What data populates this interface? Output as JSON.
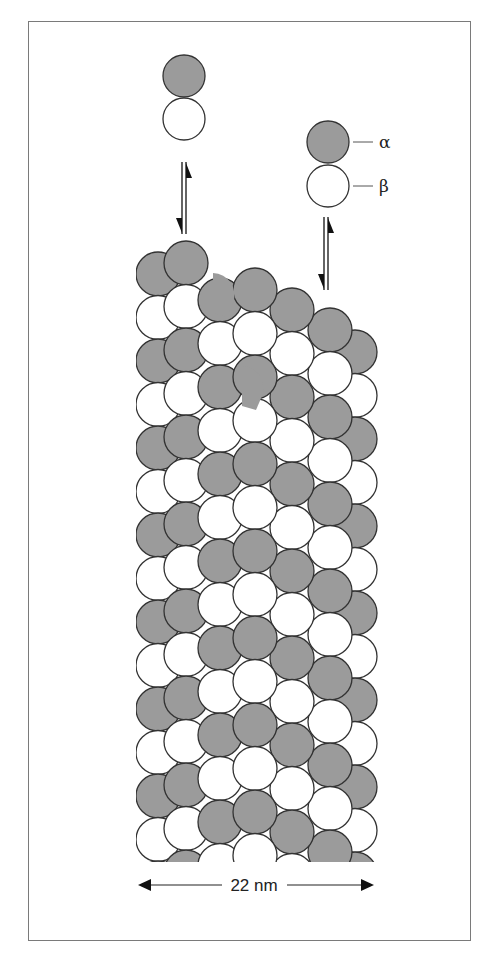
{
  "figure": {
    "subunit_labels": {
      "alpha": "α",
      "beta": "β"
    },
    "scale_bar": {
      "label": "22 nm"
    },
    "colors": {
      "alpha_fill": "#9b9b9b",
      "beta_fill": "#ffffff",
      "stroke": "#333333",
      "frame": "#7a7a7a"
    },
    "free_dimers": [
      {
        "name": "dimer-left",
        "x": 184,
        "y_alpha": 76,
        "y_beta": 120
      },
      {
        "name": "dimer-right",
        "x": 328,
        "y_alpha": 142,
        "y_beta": 186
      }
    ],
    "exchange_arrows": [
      {
        "name": "equilibrium-arrow-left",
        "x": 184,
        "y1": 162,
        "y2": 234
      },
      {
        "name": "equilibrium-arrow-right",
        "x": 326,
        "y1": 215,
        "y2": 290
      }
    ],
    "microtubule": {
      "clip_top": 240,
      "clip_bottom": 862,
      "left": 136,
      "right": 380,
      "radius": 22
    }
  }
}
